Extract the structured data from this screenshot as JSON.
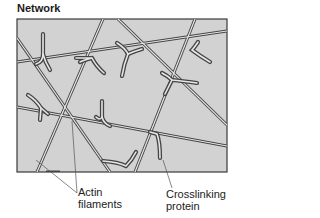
{
  "title": "Network",
  "colors": {
    "panel_fill": "#d2d2d2",
    "panel_border": "#3a3a3a",
    "filament_outline": "#444444",
    "filament_fill": "#e6e6e6",
    "leader_line": "#555555"
  },
  "labels": {
    "actin_line1": "Actin",
    "actin_line2": "filaments",
    "crosslink_line1": "Crosslinking",
    "crosslink_line2": "protein"
  }
}
